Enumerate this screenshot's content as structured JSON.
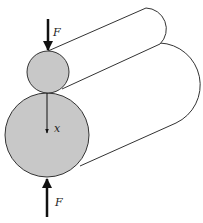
{
  "figure": {
    "labels": {
      "force_top": "F",
      "force_bottom": "F",
      "displacement": "x"
    },
    "colors": {
      "cylinder_face": "#c8c8c8",
      "outline": "#333333",
      "arrow": "#111111",
      "background": "#ffffff"
    },
    "small_cylinder": {
      "cx": 48,
      "cy": 72,
      "r": 21
    },
    "large_cylinder": {
      "cx": 47,
      "cy": 135,
      "r": 42
    }
  }
}
